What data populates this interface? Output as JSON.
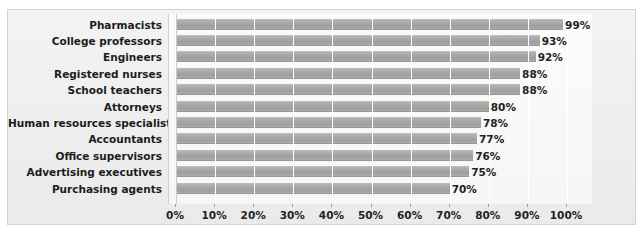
{
  "chart_data": {
    "type": "bar",
    "orientation": "horizontal",
    "title": "",
    "subtitle": "",
    "xlabel": "",
    "ylabel": "",
    "xlim": [
      0,
      100
    ],
    "grid": true,
    "legend": null,
    "categories": [
      "Pharmacists",
      "College professors",
      "Engineers",
      "Registered nurses",
      "School teachers",
      "Attorneys",
      "Human resources specialists",
      "Accountants",
      "Office supervisors",
      "Advertising executives",
      "Purchasing agents"
    ],
    "values": [
      99,
      93,
      92,
      88,
      88,
      80,
      78,
      77,
      76,
      75,
      70
    ],
    "value_labels": [
      "99%",
      "93%",
      "92%",
      "88%",
      "88%",
      "80%",
      "78%",
      "77%",
      "76%",
      "75%",
      "70%"
    ],
    "xticks": [
      0,
      10,
      20,
      30,
      40,
      50,
      60,
      70,
      80,
      90,
      100
    ],
    "xtick_labels": [
      "0%",
      "10%",
      "20%",
      "30%",
      "40%",
      "50%",
      "60%",
      "70%",
      "80%",
      "90%",
      "100%"
    ],
    "colors": {
      "bar": "#a6a6a6",
      "bar_edge": "#979797",
      "plot_background": "#f8f8f8",
      "frame_background": "#eeeeee",
      "frame_border": "#d2d2d2",
      "gridline": "#ffffff",
      "axis_line": "#c9c9c9",
      "text": "#232323"
    }
  }
}
